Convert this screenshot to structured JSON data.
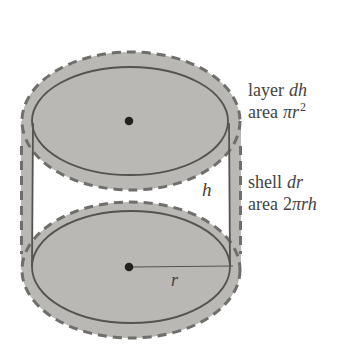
{
  "colors": {
    "bg": "#ffffff",
    "shell-band": "#b9b8b5",
    "disk-fill": "#eae9e6",
    "disk-hatch": "#deddd9",
    "dash-stroke": "#6f6e6b",
    "solid-stroke": "#55534f",
    "dot": "#232220",
    "text": "#45433f"
  },
  "annotations": {
    "layer_label": {
      "word": "layer",
      "symbol": "dh"
    },
    "layer_area": {
      "word": "area",
      "symbol": "πr",
      "sup": "2"
    },
    "shell_label": {
      "word": "shell",
      "symbol": "dr"
    },
    "shell_area": {
      "word": "area",
      "num": "2",
      "symbol": "πrh"
    },
    "height_symbol": "h",
    "radius_symbol": "r"
  }
}
